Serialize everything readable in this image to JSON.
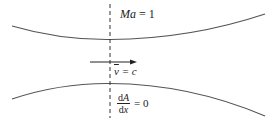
{
  "diagram": {
    "colors": {
      "wall": "#555555",
      "axis": "#333333",
      "text": "#222222",
      "background": "#ffffff"
    },
    "labels": {
      "mach": {
        "symbol": "Ma",
        "equals": " = 1"
      },
      "velocity": {
        "symbol": "v",
        "equals": " = c"
      },
      "area_derivative": {
        "numerator_d": "d",
        "numerator_var": "A",
        "denominator_d": "d",
        "denominator_var": "x",
        "equals": "= 0"
      }
    },
    "elements": {
      "upper_wall": "converging-diverging upper wall curve",
      "lower_wall": "converging-diverging lower wall curve",
      "throat_line": "dashed vertical line at throat",
      "flow_arrow": "flow direction arrow pointing right"
    }
  }
}
